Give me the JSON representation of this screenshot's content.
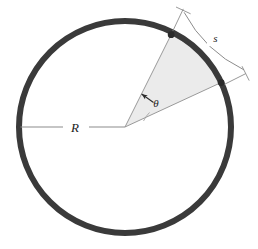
{
  "figure": {
    "type": "geometry-diagram",
    "background_color": "#ffffff"
  },
  "labels": {
    "radius": "R",
    "arc_length": "s",
    "angle": "θ"
  },
  "geometry": {
    "center": {
      "x": 125,
      "y": 127
    },
    "radius": 106,
    "circle_stroke_color": "#3a3a3a",
    "circle_stroke_width": 6,
    "sector_fill_color": "#ebebeb",
    "sector_stroke_color": "#7a7a7a",
    "sector_start_angle_deg": 24.8,
    "sector_end_angle_deg": 58.2,
    "sector_point_upper": {
      "x": 170,
      "y": 37
    },
    "sector_point_lower": {
      "x": 216,
      "y": 88
    },
    "radius_line_start": {
      "x": 125,
      "y": 127
    },
    "radius_line_end": {
      "x": 20,
      "y": 127
    },
    "radius_line_color": "#8c8c8c",
    "dimension_line_color": "#8c8c8c",
    "marker_color": "#2b2b2b",
    "marker_radius": 3.2,
    "arc_dimension_offset": 28
  },
  "annotations": {
    "radius_label_position": {
      "x": 75,
      "y": 131
    },
    "arc_label_position": {
      "x": 215,
      "y": 41
    },
    "angle_label_position": {
      "x": 155,
      "y": 106
    },
    "angle_arrow_tip": {
      "x": 140,
      "y": 93
    },
    "angle_arrow_tail": {
      "x": 152,
      "y": 101
    }
  }
}
